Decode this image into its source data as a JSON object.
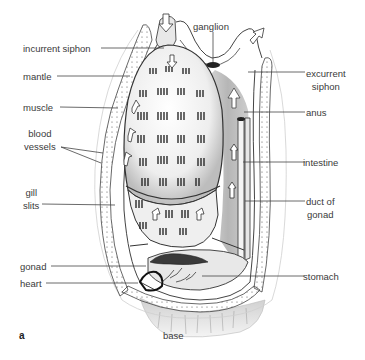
{
  "figure": {
    "letter": "a"
  },
  "labels": {
    "incurrent_siphon": "incurrent siphon",
    "ganglion": "ganglion",
    "mantle": "mantle",
    "excurrent_siphon_line1": "excurrent",
    "excurrent_siphon_line2": "siphon",
    "muscle": "muscle",
    "anus": "anus",
    "blood_vessels_line1": "blood",
    "blood_vessels_line2": "vessels",
    "intestine": "intestine",
    "gill_slits_line1": "gill",
    "gill_slits_line2": "slits",
    "duct_of_gonad_line1": "duct of",
    "duct_of_gonad_line2": "gonad",
    "gonad": "gonad",
    "stomach": "stomach",
    "heart": "heart",
    "base": "base"
  },
  "colors": {
    "line": "#444444",
    "text": "#3a3a3a",
    "ink": "#222222",
    "shade": "#9a9a9a",
    "light_shade": "#d9d9d9",
    "background": "#ffffff"
  }
}
